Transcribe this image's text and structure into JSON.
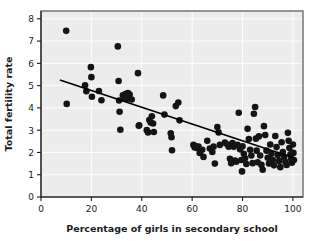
{
  "chart_data": {
    "type": "scatter",
    "title": "",
    "xlabel": "Percentage of girls in secondary school",
    "ylabel": "Total fertility rate",
    "xlim": [
      0,
      104
    ],
    "ylim": [
      0,
      8.35
    ],
    "xticks": [
      0,
      20,
      40,
      60,
      80,
      100
    ],
    "yticks": [
      0,
      1,
      2,
      3,
      4,
      5,
      6,
      7,
      8
    ],
    "xtick_labels": [
      "0",
      "20",
      "40",
      "60",
      "80",
      "100"
    ],
    "ytick_labels": [
      "0",
      "1",
      "2",
      "3",
      "4",
      "5",
      "6",
      "7",
      "8"
    ],
    "grid": true,
    "grid_color": "#ffffff",
    "plot_background": "#ececed",
    "point_color": "#141414",
    "point_radius_px": 3.3,
    "legend": null,
    "trendline": {
      "type": "linear-fit",
      "color": "#000000",
      "x_start": 7.5,
      "y_start": 5.25,
      "x_end": 100.5,
      "y_end": 1.75
    },
    "points": [
      [
        10.0,
        7.46
      ],
      [
        10.2,
        4.18
      ],
      [
        17.5,
        5.02
      ],
      [
        18.0,
        4.75
      ],
      [
        19.8,
        5.83
      ],
      [
        20.0,
        5.38
      ],
      [
        20.2,
        4.5
      ],
      [
        23.0,
        4.76
      ],
      [
        24.0,
        4.34
      ],
      [
        30.5,
        6.76
      ],
      [
        30.8,
        5.21
      ],
      [
        31.0,
        4.33
      ],
      [
        31.2,
        3.83
      ],
      [
        31.5,
        3.02
      ],
      [
        32.5,
        4.57
      ],
      [
        33.0,
        4.46
      ],
      [
        33.5,
        4.62
      ],
      [
        34.0,
        4.4
      ],
      [
        34.5,
        4.67
      ],
      [
        35.2,
        4.6
      ],
      [
        36.0,
        4.38
      ],
      [
        38.5,
        5.56
      ],
      [
        38.8,
        3.2
      ],
      [
        39.0,
        3.22
      ],
      [
        42.0,
        3.0
      ],
      [
        42.5,
        2.9
      ],
      [
        43.0,
        3.46
      ],
      [
        43.5,
        3.34
      ],
      [
        44.0,
        3.62
      ],
      [
        44.5,
        3.3
      ],
      [
        44.8,
        2.92
      ],
      [
        48.5,
        4.56
      ],
      [
        49.0,
        3.7
      ],
      [
        51.5,
        2.86
      ],
      [
        51.8,
        2.68
      ],
      [
        52.0,
        2.1
      ],
      [
        53.5,
        4.08
      ],
      [
        54.5,
        4.24
      ],
      [
        55.0,
        3.44
      ],
      [
        60.5,
        2.34
      ],
      [
        61.0,
        2.22
      ],
      [
        61.5,
        2.28
      ],
      [
        62.0,
        2.2
      ],
      [
        62.5,
        2.26
      ],
      [
        63.0,
        1.98
      ],
      [
        64.0,
        2.12
      ],
      [
        64.5,
        1.8
      ],
      [
        66.0,
        2.52
      ],
      [
        67.0,
        2.18
      ],
      [
        68.0,
        2.02
      ],
      [
        68.5,
        2.26
      ],
      [
        69.0,
        1.5
      ],
      [
        70.0,
        3.14
      ],
      [
        70.5,
        2.9
      ],
      [
        71.0,
        2.34
      ],
      [
        73.0,
        2.44
      ],
      [
        74.0,
        2.36
      ],
      [
        74.5,
        2.26
      ],
      [
        75.0,
        1.72
      ],
      [
        75.5,
        1.52
      ],
      [
        76.0,
        2.42
      ],
      [
        76.5,
        2.26
      ],
      [
        77.0,
        1.64
      ],
      [
        77.5,
        1.58
      ],
      [
        78.0,
        2.34
      ],
      [
        78.5,
        3.78
      ],
      [
        79.0,
        2.14
      ],
      [
        79.5,
        1.66
      ],
      [
        79.8,
        1.15
      ],
      [
        80.0,
        2.28
      ],
      [
        80.5,
        1.94
      ],
      [
        81.0,
        1.74
      ],
      [
        81.5,
        1.48
      ],
      [
        82.0,
        3.06
      ],
      [
        82.5,
        2.6
      ],
      [
        83.0,
        2.12
      ],
      [
        83.5,
        1.86
      ],
      [
        84.0,
        1.52
      ],
      [
        84.5,
        3.74
      ],
      [
        85.0,
        4.04
      ],
      [
        85.3,
        2.62
      ],
      [
        85.6,
        2.08
      ],
      [
        86.0,
        1.56
      ],
      [
        86.5,
        2.72
      ],
      [
        87.0,
        1.86
      ],
      [
        87.5,
        1.44
      ],
      [
        88.0,
        1.22
      ],
      [
        88.5,
        3.18
      ],
      [
        89.0,
        2.78
      ],
      [
        89.5,
        2.08
      ],
      [
        90.0,
        1.76
      ],
      [
        90.5,
        1.5
      ],
      [
        91.0,
        2.36
      ],
      [
        91.5,
        1.94
      ],
      [
        92.0,
        1.66
      ],
      [
        92.5,
        1.42
      ],
      [
        93.0,
        2.74
      ],
      [
        93.5,
        2.24
      ],
      [
        94.0,
        1.88
      ],
      [
        94.5,
        1.62
      ],
      [
        95.0,
        1.34
      ],
      [
        95.5,
        2.46
      ],
      [
        96.0,
        2.02
      ],
      [
        96.5,
        1.8
      ],
      [
        97.0,
        1.58
      ],
      [
        97.5,
        1.44
      ],
      [
        98.0,
        2.88
      ],
      [
        98.3,
        2.52
      ],
      [
        98.6,
        2.2
      ],
      [
        99.0,
        1.92
      ],
      [
        99.3,
        1.72
      ],
      [
        99.6,
        1.54
      ],
      [
        100.0,
        2.36
      ],
      [
        100.2,
        1.98
      ],
      [
        100.4,
        1.66
      ]
    ]
  }
}
